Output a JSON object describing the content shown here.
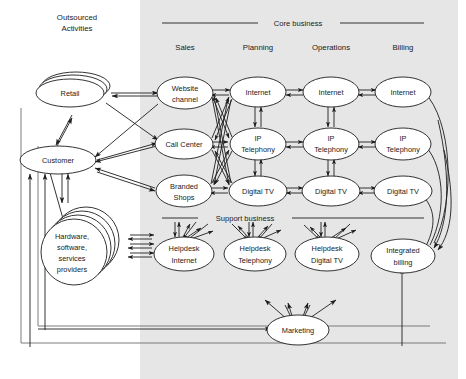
{
  "figure": {
    "type": "block-flow-diagram",
    "background_color": "#ffffff",
    "shaded_region_color": "#e6e6e6",
    "line_color": "#1d1d1d"
  },
  "regions": {
    "outsourced": {
      "title_line1": "Outsourced",
      "title_line2": "Activities"
    },
    "core_business": {
      "label": "Core business"
    },
    "support_business": {
      "label": "Support business"
    }
  },
  "column_headers": [
    {
      "label": "Sales"
    },
    {
      "label": "Planning"
    },
    {
      "label": "Operations"
    },
    {
      "label": "Billing"
    }
  ],
  "outsourced_nodes": [
    {
      "id": "retail",
      "label": "Retail",
      "shape": "stacked-ellipse",
      "stack": 3
    },
    {
      "id": "customer",
      "label": "Customer",
      "shape": "ellipse",
      "stack": 1
    },
    {
      "id": "providers",
      "label_lines": [
        "Hardware,",
        "software,",
        "services",
        "providers"
      ],
      "shape": "stacked-ellipse",
      "stack": 4
    }
  ],
  "core_nodes": {
    "sales": [
      {
        "id": "website",
        "label_lines": [
          "Website",
          "channel"
        ]
      },
      {
        "id": "callcenter",
        "label_lines": [
          "Call Center"
        ]
      },
      {
        "id": "brandedshops",
        "label_lines": [
          "Branded",
          "Shops"
        ]
      }
    ],
    "planning": [
      {
        "id": "plan-internet",
        "label_lines": [
          "Internet"
        ]
      },
      {
        "id": "plan-iptel",
        "label_lines": [
          "IP",
          "Telephony"
        ]
      },
      {
        "id": "plan-digitaltv",
        "label_lines": [
          "Digital TV"
        ]
      }
    ],
    "operations": [
      {
        "id": "ops-internet",
        "label_lines": [
          "Internet"
        ]
      },
      {
        "id": "ops-iptel",
        "label_lines": [
          "IP",
          "Telephony"
        ]
      },
      {
        "id": "ops-digitaltv",
        "label_lines": [
          "Digital TV"
        ]
      }
    ],
    "billing": [
      {
        "id": "bill-internet",
        "label_lines": [
          "Internet"
        ]
      },
      {
        "id": "bill-iptel",
        "label_lines": [
          "IP",
          "Telephony"
        ]
      },
      {
        "id": "bill-digitaltv",
        "label_lines": [
          "Digital TV"
        ]
      }
    ]
  },
  "support_nodes": [
    {
      "id": "hd-internet",
      "label_lines": [
        "Helpdesk",
        "Internet"
      ]
    },
    {
      "id": "hd-telephony",
      "label_lines": [
        "Helpdesk",
        "Telephony"
      ]
    },
    {
      "id": "hd-digitaltv",
      "label_lines": [
        "Helpdesk",
        "Digital TV"
      ]
    },
    {
      "id": "integrated-billing",
      "label_lines": [
        "Integrated",
        "billing"
      ]
    }
  ],
  "bottom_nodes": [
    {
      "id": "marketing",
      "label": "Marketing"
    }
  ]
}
